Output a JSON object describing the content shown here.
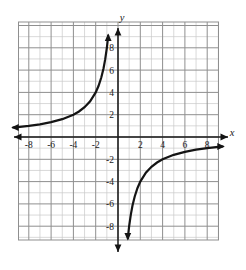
{
  "chart_data": {
    "type": "line",
    "title": "",
    "xlabel": "x",
    "ylabel": "y",
    "xlim": [
      -9.5,
      9.5
    ],
    "ylim": [
      -9.5,
      9.5
    ],
    "grid": true,
    "grid_minor_step": 1,
    "grid_major_step": 2,
    "legend": "none",
    "function": "y = -8/x",
    "asymptotes": {
      "vertical": "x = 0",
      "horizontal": "y = 0"
    },
    "xticks": [
      -8,
      -6,
      -4,
      -2,
      2,
      4,
      6,
      8
    ],
    "xtick_labels": [
      "-8",
      "-6",
      "-4",
      "-2",
      "2",
      "4",
      "6",
      "8"
    ],
    "yticks": [
      8,
      6,
      4,
      2,
      -2,
      -4,
      -6,
      -8
    ],
    "ytick_labels": [
      "8",
      "6",
      "4",
      "2",
      "-2",
      "-4",
      "-6",
      "-8"
    ],
    "series": [
      {
        "name": "left-branch",
        "quadrant": "II",
        "points": [
          [
            -9.4,
            0.85
          ],
          [
            -9.0,
            0.89
          ],
          [
            -8.0,
            1.0
          ],
          [
            -7.0,
            1.14
          ],
          [
            -6.0,
            1.33
          ],
          [
            -5.0,
            1.6
          ],
          [
            -4.0,
            2.0
          ],
          [
            -3.5,
            2.29
          ],
          [
            -3.0,
            2.67
          ],
          [
            -2.5,
            3.2
          ],
          [
            -2.0,
            4.0
          ],
          [
            -1.75,
            4.57
          ],
          [
            -1.5,
            5.33
          ],
          [
            -1.3,
            6.15
          ],
          [
            -1.15,
            6.96
          ],
          [
            -1.0,
            8.0
          ],
          [
            -0.92,
            8.7
          ],
          [
            -0.88,
            9.1
          ]
        ],
        "arrow_end": "left"
      },
      {
        "name": "right-branch",
        "quadrant": "IV",
        "points": [
          [
            0.88,
            -9.1
          ],
          [
            0.92,
            -8.7
          ],
          [
            1.0,
            -8.0
          ],
          [
            1.15,
            -6.96
          ],
          [
            1.3,
            -6.15
          ],
          [
            1.5,
            -5.33
          ],
          [
            1.75,
            -4.57
          ],
          [
            2.0,
            -4.0
          ],
          [
            2.5,
            -3.2
          ],
          [
            3.0,
            -2.67
          ],
          [
            3.5,
            -2.29
          ],
          [
            4.0,
            -2.0
          ],
          [
            5.0,
            -1.6
          ],
          [
            6.0,
            -1.33
          ],
          [
            7.0,
            -1.14
          ],
          [
            8.0,
            -1.0
          ],
          [
            9.0,
            -0.89
          ],
          [
            9.4,
            -0.85
          ]
        ],
        "arrow_end": "right"
      }
    ],
    "colors": {
      "background": "#ffffff",
      "minor_grid": "#c9c9c9",
      "major_grid": "#8f8f8f",
      "axis": "#1a1a1a",
      "curve": "#141414",
      "label": "#1a1a1a"
    }
  },
  "axes": {
    "x_label": "x",
    "y_label": "y"
  }
}
